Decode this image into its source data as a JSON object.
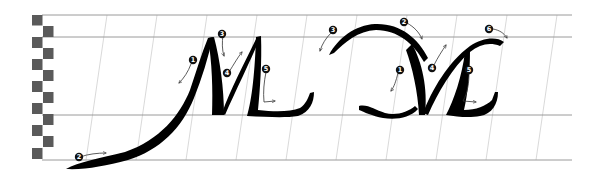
{
  "diagram": {
    "colors": {
      "background": "#ffffff",
      "ink": "#000000",
      "guide_line": "#9a9a9a",
      "slant_line": "#c8c8c8",
      "nib_square": "#5a5a5a",
      "arrow": "#333333",
      "marker_fill": "#111111",
      "marker_text": "#ffffff"
    },
    "guidelines": {
      "ascender_y": 15,
      "waist_y": 37,
      "baseline_y": 115,
      "descender_y": 160,
      "x_start": 42,
      "x_end": 572
    },
    "nib_ladder": {
      "count": 12,
      "square_size": 10.5
    },
    "letters": [
      {
        "name": "M-variant-1",
        "strokes": [
          {
            "number": "1",
            "label": "❶"
          },
          {
            "number": "2",
            "label": "❷"
          },
          {
            "number": "3",
            "label": "❸"
          },
          {
            "number": "4",
            "label": "❹"
          },
          {
            "number": "5",
            "label": "❺"
          }
        ]
      },
      {
        "name": "M-variant-2",
        "strokes": [
          {
            "number": "1",
            "label": "❶"
          },
          {
            "number": "2",
            "label": "❷"
          },
          {
            "number": "3",
            "label": "❸"
          },
          {
            "number": "4",
            "label": "❹"
          },
          {
            "number": "5",
            "label": "❺"
          },
          {
            "number": "6",
            "label": "❻"
          }
        ]
      }
    ]
  }
}
